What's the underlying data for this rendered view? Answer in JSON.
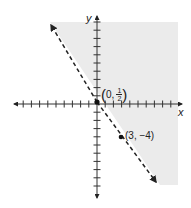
{
  "chart_data": {
    "type": "line",
    "title": "",
    "xlabel": "x",
    "ylabel": "y",
    "xlim": [
      -10,
      10
    ],
    "ylim": [
      -11,
      11
    ],
    "grid": false,
    "boundary": {
      "style": "dashed",
      "slope": -1.5,
      "intercept": 0.5,
      "equation": "y = -3/2 x + 1/2"
    },
    "shaded_side": "right/above the line",
    "shade_color": "#ebebeb",
    "points": [
      {
        "x": 0,
        "y": 0.5,
        "label_text": "0,",
        "label_frac_num": "1",
        "label_frac_den": "2"
      },
      {
        "x": 3,
        "y": -4,
        "label": "(3, −4)"
      }
    ]
  },
  "labels": {
    "x_axis": "x",
    "y_axis": "y",
    "point1_prefix": "0,",
    "point1_num": "1",
    "point1_den": "2",
    "point1_open": "(",
    "point1_close": ")",
    "point2": "(3, −4)"
  }
}
